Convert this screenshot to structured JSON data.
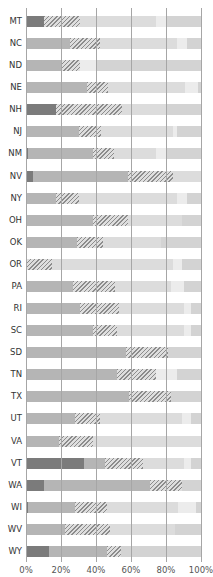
{
  "chart_data": {
    "type": "bar",
    "orientation": "horizontal",
    "stacked": true,
    "title": "",
    "xlabel": "",
    "ylabel": "",
    "xlim": [
      0,
      100
    ],
    "x_ticks": [
      "0%",
      "20%",
      "40%",
      "60%",
      "80%",
      "100%"
    ],
    "grid": true,
    "legend": [],
    "segment_styles": [
      "dark",
      "medium",
      "hatched",
      "light",
      "lighter",
      "end"
    ],
    "categories": [
      "MT",
      "NC",
      "ND",
      "NE",
      "NH",
      "NJ",
      "NM",
      "NV",
      "NY",
      "OH",
      "OK",
      "OR",
      "PA",
      "RI",
      "SC",
      "SD",
      "TN",
      "TX",
      "UT",
      "VA",
      "VT",
      "WA",
      "WI",
      "WV",
      "WY"
    ],
    "series": [
      {
        "name": "dark",
        "values": [
          10,
          0,
          0,
          0,
          17,
          0,
          1,
          4,
          0,
          0,
          0,
          0,
          0,
          0,
          0,
          0,
          0,
          0,
          0,
          0,
          33,
          10,
          1,
          0,
          13
        ]
      },
      {
        "name": "medium",
        "values": [
          0,
          25,
          20,
          35,
          0,
          30,
          37,
          54,
          17,
          38,
          29,
          0,
          27,
          31,
          38,
          57,
          52,
          59,
          28,
          19,
          12,
          61,
          27,
          22,
          33
        ]
      },
      {
        "name": "hatched",
        "values": [
          21,
          17,
          11,
          12,
          38,
          13,
          12,
          26,
          13,
          20,
          15,
          15,
          24,
          22,
          14,
          24,
          22,
          24,
          14,
          19,
          22,
          18,
          18,
          26,
          8
        ]
      },
      {
        "name": "light",
        "values": [
          43,
          44,
          0,
          44,
          25,
          41,
          24,
          16,
          56,
          31,
          33,
          69,
          32,
          37,
          38,
          0,
          0,
          0,
          47,
          62,
          23,
          0,
          41,
          37,
          0
        ]
      },
      {
        "name": "lighter",
        "values": [
          6,
          6,
          9,
          7,
          0,
          2,
          6,
          0,
          6,
          0,
          0,
          5,
          7,
          4,
          4,
          0,
          12,
          0,
          5,
          0,
          4,
          0,
          10,
          0,
          0
        ]
      },
      {
        "name": "end",
        "values": [
          20,
          8,
          60,
          2,
          20,
          14,
          20,
          0,
          8,
          11,
          23,
          11,
          10,
          6,
          6,
          19,
          14,
          17,
          6,
          0,
          6,
          11,
          3,
          15,
          46
        ]
      }
    ]
  }
}
